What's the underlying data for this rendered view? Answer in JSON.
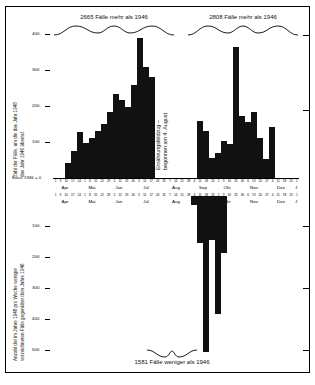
{
  "figure": {
    "top_caption_left": "2665 Fälle mehr als 1946",
    "top_caption_right": "2808 Fälle mehr als 1946",
    "bottom_caption": "1581 Fälle weniger als 1946",
    "annotation_line1": "Ernährungsfeldzug –",
    "annotation_line2": "begonnen am 4. August",
    "baseline_label": "Basis 1946 = 0"
  },
  "upper": {
    "ylabel_line1": "Zahl der Fälle, um die das Jahr 1948",
    "ylabel_line2": "das Jahr 1946 überraf.",
    "yticks": [
      "400",
      "300",
      "200",
      "100"
    ]
  },
  "lower": {
    "ylabel_line1": "Anzahl der im Jahre 1948 pro Woche weniger",
    "ylabel_line2": "verzeichneten Fälle gegenüber dem Jahre 1946",
    "yticks": [
      "100",
      "200",
      "300",
      "400",
      "500"
    ]
  },
  "months": [
    "Apr",
    "Mai",
    "Jun",
    "Jul",
    "Aug",
    "Sep",
    "Okt",
    "Nov",
    "Dez",
    "J"
  ],
  "week_labels": [
    "1",
    "3",
    "10",
    "17",
    "24",
    "1",
    "8",
    "15",
    "22",
    "29",
    "5",
    "12",
    "19",
    "26",
    "3",
    "10",
    "17",
    "24",
    "31",
    "7",
    "14",
    "21",
    "28",
    "4",
    "11",
    "18",
    "25",
    "2",
    "9",
    "16",
    "23",
    "30",
    "6",
    "13",
    "20",
    "27",
    "4",
    "11",
    "18",
    "25",
    "1"
  ],
  "chart_data": {
    "type": "bar",
    "xlabel": "",
    "ylabel": "Fälle",
    "grid": false,
    "legend": "none",
    "x": [
      "1",
      "3",
      "10",
      "17",
      "24",
      "1",
      "8",
      "15",
      "22",
      "29",
      "5",
      "12",
      "19",
      "26",
      "3",
      "10",
      "17",
      "24",
      "31",
      "7",
      "14",
      "21",
      "28",
      "4",
      "11",
      "18",
      "25",
      "2",
      "9",
      "16",
      "23",
      "30",
      "6",
      "13",
      "20",
      "27",
      "4",
      "11",
      "18",
      "25",
      "1"
    ],
    "series": [
      {
        "name": "Mehr Fälle als 1946 (oberes Diagramm)",
        "ylim": [
          0,
          430
        ],
        "yticks": [
          100,
          200,
          300,
          400
        ],
        "values": [
          0,
          0,
          45,
          80,
          135,
          105,
          120,
          140,
          160,
          195,
          250,
          230,
          210,
          275,
          415,
          330,
          300,
          0,
          0,
          0,
          0,
          0,
          0,
          0,
          170,
          140,
          60,
          75,
          110,
          100,
          390,
          185,
          165,
          195,
          120,
          55,
          150,
          0,
          0,
          0,
          0
        ]
      },
      {
        "name": "Weniger Fälle als 1946 (unteres Diagramm)",
        "ylim": [
          0,
          560
        ],
        "yticks": [
          100,
          200,
          300,
          400,
          500
        ],
        "values": [
          0,
          0,
          0,
          0,
          0,
          0,
          0,
          0,
          0,
          0,
          0,
          0,
          0,
          0,
          0,
          0,
          0,
          0,
          0,
          0,
          0,
          0,
          0,
          30,
          160,
          530,
          150,
          400,
          195,
          0,
          0,
          0,
          0,
          0,
          0,
          0,
          0,
          0,
          0,
          0,
          0
        ]
      }
    ],
    "annotations": [
      {
        "text": "2665 Fälle mehr als 1946",
        "position": "top-left"
      },
      {
        "text": "2808 Fälle mehr als 1946",
        "position": "top-right"
      },
      {
        "text": "1581 Fälle weniger als 1946",
        "position": "bottom-center"
      },
      {
        "text": "Ernährungsfeldzug – begonnen am 4. August",
        "position": "center"
      },
      {
        "text": "Basis 1946 = 0",
        "position": "baseline-left"
      }
    ]
  }
}
